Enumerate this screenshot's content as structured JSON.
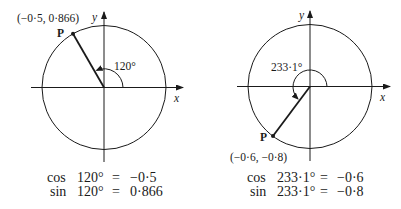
{
  "left_diagram": {
    "axis_x_label": "x",
    "axis_y_label": "y",
    "point_label": "P",
    "point_coords": "(−0·5, 0·866)",
    "angle_label": "120°",
    "angle_deg": 120,
    "equations": [
      {
        "fn": "cos",
        "angle": "120°",
        "eq": "=",
        "value": "−0·5"
      },
      {
        "fn": "sin",
        "angle": "120°",
        "eq": "=",
        "value": "0·866"
      }
    ]
  },
  "right_diagram": {
    "axis_x_label": "x",
    "axis_y_label": "y",
    "point_label": "P",
    "point_coords": "(−0·6, −0·8)",
    "angle_label": "233·1°",
    "angle_deg": 233.1,
    "equations": [
      {
        "fn": "cos",
        "angle": "233·1°",
        "eq": "=",
        "value": "−0·6"
      },
      {
        "fn": "sin",
        "angle": "233·1°",
        "eq": "=",
        "value": "−0·8"
      }
    ]
  },
  "colors": {
    "ink": "#1a1a1a",
    "background": "#ffffff"
  }
}
